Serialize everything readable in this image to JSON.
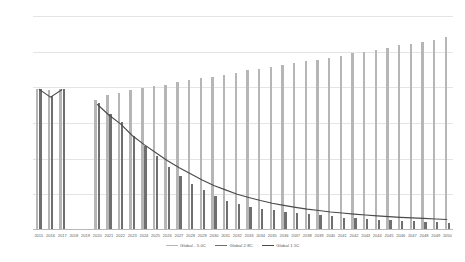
{
  "chart_data": {
    "type": "bar",
    "title": "",
    "xlabel": "",
    "ylabel": "",
    "ylim": [
      0,
      12000
    ],
    "ytick_values": [
      0,
      2000,
      4000,
      6000,
      8000,
      10000,
      12000
    ],
    "ytick_labels": [
      "0",
      "2,000",
      "4,000",
      "6,000",
      "8,000",
      "10,000",
      "12,000"
    ],
    "grid": true,
    "legend_position": "bottom",
    "categories": [
      "2015",
      "2016",
      "2017",
      "2018",
      "2019",
      "2020",
      "2021",
      "2022",
      "2023",
      "2024",
      "2025",
      "2026",
      "2027",
      "2028",
      "2029",
      "2030",
      "2031",
      "2032",
      "2033",
      "2034",
      "2035",
      "2036",
      "2037",
      "2038",
      "2039",
      "2040",
      "2041",
      "2042",
      "2043",
      "2044",
      "2045",
      "2046",
      "2047",
      "2048",
      "2049",
      "2050"
    ],
    "series": [
      {
        "name": "Global - 5.0C",
        "type": "bar",
        "color": "#b6b6b6",
        "values": [
          7900,
          7850,
          7880,
          null,
          null,
          7300,
          7550,
          7700,
          7850,
          7950,
          8050,
          8150,
          8300,
          8400,
          8500,
          8600,
          8700,
          8800,
          8950,
          9050,
          9150,
          9250,
          9350,
          9450,
          9550,
          9650,
          9750,
          9900,
          10000,
          10100,
          10200,
          10350,
          10450,
          10550,
          10650,
          10800
        ]
      },
      {
        "name": "Global 2.8C",
        "type": "bar",
        "color": "#6f6f6f",
        "values": [
          7900,
          7500,
          7880,
          null,
          null,
          7100,
          6500,
          6050,
          5250,
          4700,
          4150,
          3550,
          3050,
          2600,
          2250,
          1900,
          1650,
          1450,
          1300,
          1200,
          1100,
          1000,
          950,
          880,
          820,
          760,
          700,
          660,
          620,
          580,
          540,
          510,
          480,
          450,
          430,
          400
        ]
      },
      {
        "name": "Global 1.5C",
        "type": "line",
        "color": "#4a4a4a",
        "values": [
          7900,
          7450,
          7880,
          null,
          null,
          7050,
          6450,
          5950,
          5300,
          4800,
          4350,
          3900,
          3500,
          3150,
          2800,
          2500,
          2250,
          2000,
          1820,
          1650,
          1500,
          1380,
          1270,
          1170,
          1090,
          1010,
          950,
          890,
          840,
          790,
          750,
          710,
          680,
          650,
          620,
          590
        ]
      }
    ],
    "legend": [
      {
        "label": "Global - 5.0C",
        "color": "#b6b6b6"
      },
      {
        "label": "Global 2.8C",
        "color": "#6f6f6f"
      },
      {
        "label": "Global 1.5C",
        "color": "#4a4a4a"
      }
    ]
  }
}
